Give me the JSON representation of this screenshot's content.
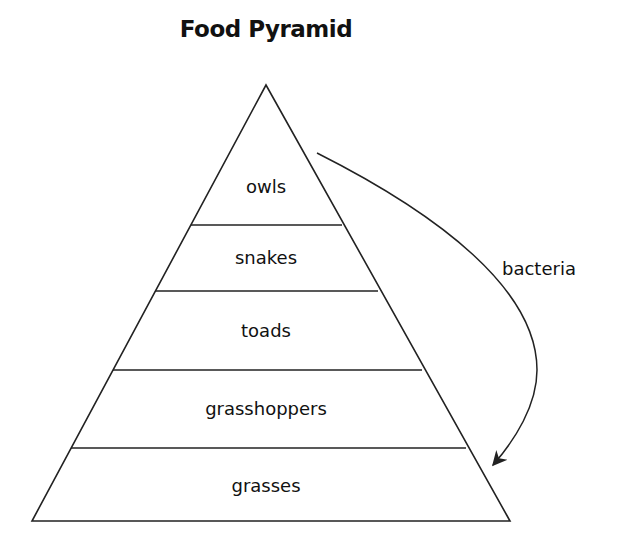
{
  "title": "Food Pyramid",
  "levels": [
    {
      "label": "owls"
    },
    {
      "label": "snakes"
    },
    {
      "label": "toads"
    },
    {
      "label": "grasshoppers"
    },
    {
      "label": "grasses"
    }
  ],
  "arrow": {
    "label": "bacteria",
    "from": "owls",
    "to": "grasses"
  },
  "colors": {
    "line": "#222222",
    "background": "#ffffff"
  }
}
